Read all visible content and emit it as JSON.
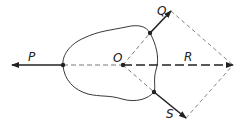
{
  "diagram": {
    "labels": {
      "P": "P",
      "O": "O",
      "Q": "Q",
      "R": "R",
      "S": "S"
    },
    "colors": {
      "stroke": "#222222",
      "dashed": "#555555",
      "background": "#ffffff"
    },
    "points": {
      "O": [
        123,
        65
      ],
      "P_application": [
        63,
        65
      ],
      "P_tip": [
        12,
        65
      ],
      "Q_application": [
        150,
        33
      ],
      "Q_tip": [
        171,
        11
      ],
      "S_application": [
        154,
        92
      ],
      "S_tip": [
        186,
        118
      ],
      "R_tip": [
        233,
        65
      ]
    }
  }
}
